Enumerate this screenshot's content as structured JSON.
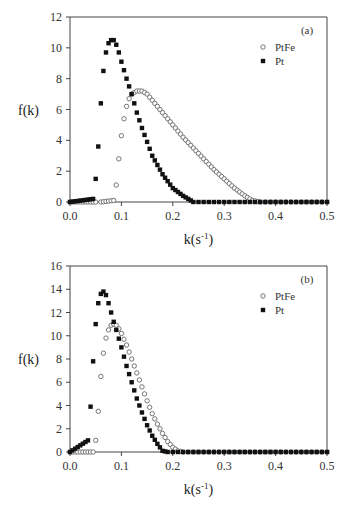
{
  "chart_data": [
    {
      "type": "scatter",
      "panel_label": "(a)",
      "title": "",
      "xlabel": "k(s-1)",
      "ylabel": "f(k)",
      "xlim": [
        0.0,
        0.5
      ],
      "ylim": [
        0,
        12
      ],
      "xticks": [
        "0.0",
        "0.1",
        "0.2",
        "0.3",
        "0.4",
        "0.5"
      ],
      "yticks": [
        "0",
        "2",
        "4",
        "6",
        "8",
        "10",
        "12"
      ],
      "grid": false,
      "legend_position": "upper right",
      "series": [
        {
          "name": "PtFe",
          "marker": "open-circle",
          "x": [
            0.0,
            0.06,
            0.085,
            0.09,
            0.095,
            0.1,
            0.105,
            0.11,
            0.115,
            0.12,
            0.13,
            0.14,
            0.15,
            0.16,
            0.18,
            0.2,
            0.22,
            0.24,
            0.26,
            0.28,
            0.3,
            0.32,
            0.34,
            0.355,
            0.37,
            0.4,
            0.45,
            0.5
          ],
          "values": [
            0,
            0,
            0.1,
            1.1,
            2.8,
            4.3,
            5.4,
            6.2,
            6.7,
            7.0,
            7.2,
            7.2,
            7.0,
            6.6,
            5.8,
            5.0,
            4.2,
            3.5,
            2.8,
            2.1,
            1.5,
            0.9,
            0.4,
            0.1,
            0,
            0,
            0,
            0
          ]
        },
        {
          "name": "Pt",
          "marker": "filled-square",
          "x": [
            0.0,
            0.045,
            0.05,
            0.055,
            0.06,
            0.065,
            0.07,
            0.075,
            0.08,
            0.085,
            0.09,
            0.095,
            0.1,
            0.11,
            0.12,
            0.13,
            0.14,
            0.15,
            0.16,
            0.18,
            0.2,
            0.22,
            0.24,
            0.25,
            0.3,
            0.4,
            0.47
          ],
          "values": [
            0,
            0.2,
            1.5,
            3.6,
            6.4,
            8.5,
            9.7,
            10.3,
            10.5,
            10.5,
            10.2,
            9.7,
            9.1,
            8.0,
            7.0,
            5.8,
            4.8,
            3.9,
            3.0,
            1.8,
            0.9,
            0.4,
            0.0,
            0,
            0,
            0,
            0
          ]
        }
      ]
    },
    {
      "type": "scatter",
      "panel_label": "(b)",
      "title": "",
      "xlabel": "k(s-1)",
      "ylabel": "f(k)",
      "xlim": [
        0.0,
        0.5
      ],
      "ylim": [
        0,
        16
      ],
      "xticks": [
        "0.0",
        "0.1",
        "0.2",
        "0.3",
        "0.4",
        "0.5"
      ],
      "yticks": [
        "0",
        "2",
        "4",
        "6",
        "8",
        "10",
        "12",
        "14",
        "16"
      ],
      "grid": false,
      "legend_position": "upper right",
      "series": [
        {
          "name": "PtFe",
          "marker": "open-circle",
          "x": [
            0.0,
            0.045,
            0.05,
            0.055,
            0.06,
            0.065,
            0.07,
            0.075,
            0.08,
            0.085,
            0.09,
            0.095,
            0.1,
            0.11,
            0.12,
            0.13,
            0.14,
            0.15,
            0.16,
            0.17,
            0.18,
            0.19,
            0.2,
            0.21,
            0.22,
            0.3,
            0.4,
            0.5
          ],
          "values": [
            0,
            0,
            1.0,
            3.5,
            6.5,
            8.5,
            9.8,
            10.5,
            10.9,
            11.0,
            10.9,
            10.6,
            10.2,
            9.2,
            8.0,
            6.8,
            5.6,
            4.4,
            3.3,
            2.4,
            1.6,
            0.9,
            0.4,
            0.1,
            0,
            0,
            0,
            0
          ]
        },
        {
          "name": "Pt",
          "marker": "filled-square",
          "x": [
            0.0,
            0.035,
            0.04,
            0.045,
            0.05,
            0.055,
            0.06,
            0.065,
            0.07,
            0.075,
            0.08,
            0.085,
            0.09,
            0.1,
            0.11,
            0.12,
            0.13,
            0.14,
            0.15,
            0.16,
            0.17,
            0.18,
            0.19,
            0.3,
            0.4,
            0.5
          ],
          "values": [
            0,
            1.0,
            3.9,
            7.8,
            11.0,
            12.8,
            13.6,
            13.8,
            13.5,
            12.8,
            12.0,
            11.2,
            10.5,
            9.0,
            7.4,
            6.0,
            4.6,
            3.4,
            2.3,
            1.4,
            0.7,
            0.1,
            0,
            0,
            0,
            0
          ]
        }
      ]
    }
  ]
}
